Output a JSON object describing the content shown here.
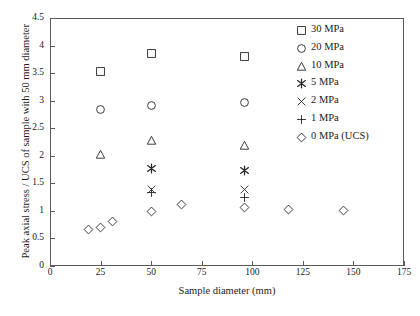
{
  "chart_data": {
    "type": "scatter",
    "title": "",
    "xlabel": "Sample diameter (mm)",
    "ylabel": "Peak axial stress / UCS of sample with 50 mm diameter",
    "xlim": [
      0,
      175
    ],
    "ylim": [
      0,
      4.5
    ],
    "xticks": [
      0,
      25,
      50,
      75,
      100,
      125,
      150,
      175
    ],
    "xtick_labels": [
      "0",
      "25",
      "50",
      "75",
      "100",
      "125",
      "150",
      "175"
    ],
    "yticks": [
      0,
      0.5,
      1,
      1.5,
      2,
      2.5,
      3,
      3.5,
      4,
      4.5
    ],
    "ytick_labels": [
      "0",
      "0.5",
      "1",
      "1.5",
      "2",
      "2.5",
      "3",
      "3.5",
      "4",
      "4.5"
    ],
    "grid": false,
    "legend_position": "top-right",
    "marker_color": "#262626",
    "series": [
      {
        "name": "30 MPa",
        "marker": "square",
        "points": [
          {
            "x": 25,
            "y": 3.53
          },
          {
            "x": 50,
            "y": 3.86
          },
          {
            "x": 96,
            "y": 3.8
          }
        ]
      },
      {
        "name": "20 MPa",
        "marker": "circle",
        "points": [
          {
            "x": 25,
            "y": 2.84
          },
          {
            "x": 50,
            "y": 2.91
          },
          {
            "x": 96,
            "y": 2.97
          }
        ]
      },
      {
        "name": "10 MPa",
        "marker": "triangle",
        "points": [
          {
            "x": 25,
            "y": 2.02
          },
          {
            "x": 50,
            "y": 2.28
          },
          {
            "x": 96,
            "y": 2.18
          }
        ]
      },
      {
        "name": "5 MPa",
        "marker": "asterisk",
        "points": [
          {
            "x": 50,
            "y": 1.77
          },
          {
            "x": 96,
            "y": 1.73
          }
        ]
      },
      {
        "name": "2 MPa",
        "marker": "cross",
        "points": [
          {
            "x": 50,
            "y": 1.39
          },
          {
            "x": 96,
            "y": 1.39
          }
        ]
      },
      {
        "name": "1 MPa",
        "marker": "plus",
        "points": [
          {
            "x": 50,
            "y": 1.34
          },
          {
            "x": 96,
            "y": 1.25
          }
        ]
      },
      {
        "name": "0 MPa (UCS)",
        "marker": "diamond",
        "points": [
          {
            "x": 19,
            "y": 0.66
          },
          {
            "x": 25,
            "y": 0.7
          },
          {
            "x": 31,
            "y": 0.8
          },
          {
            "x": 50,
            "y": 0.99
          },
          {
            "x": 65,
            "y": 1.11
          },
          {
            "x": 96,
            "y": 1.06
          },
          {
            "x": 118,
            "y": 1.03
          },
          {
            "x": 145,
            "y": 1.01
          }
        ]
      }
    ]
  }
}
